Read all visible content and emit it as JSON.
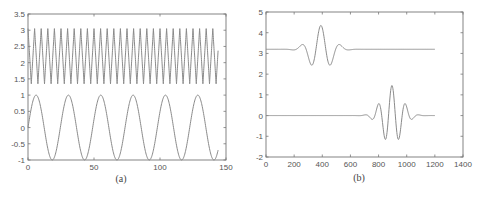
{
  "chart_data": [
    {
      "id": "a",
      "type": "line",
      "caption": "(a)",
      "title": "",
      "xlabel": "",
      "ylabel": "",
      "xlim": [
        0,
        150
      ],
      "ylim": [
        -1,
        3.5
      ],
      "xticks": [
        0,
        50,
        100,
        150
      ],
      "xtick_labels": [
        "0",
        "50",
        "100",
        "150"
      ],
      "yticks": [
        -1,
        -0.5,
        0,
        0.5,
        1,
        1.5,
        2,
        2.5,
        3,
        3.5
      ],
      "ytick_labels": [
        "-1",
        "-0.5",
        "0",
        "0.5",
        "1",
        "1.5",
        "2",
        "2.5",
        "3",
        "3.5"
      ],
      "grid": false,
      "legend": null,
      "series": [
        {
          "name": "high-frequency triangle wave",
          "kind": "triangle",
          "x_range": [
            0,
            144
          ],
          "min": 1.35,
          "max": 3.05,
          "period": 5.0,
          "phase_start_value": 2.2,
          "end_value": 2.2
        },
        {
          "name": "low-frequency sine wave",
          "kind": "sine",
          "x_range": [
            0,
            144
          ],
          "amplitude": 1.0,
          "offset": 0.0,
          "period": 24.5,
          "start_value": 0.0,
          "peaks_x": [
            6,
            30.5,
            55,
            79.5,
            104,
            128.5
          ],
          "troughs_x": [
            18.4,
            42.9,
            67.4,
            91.9,
            116.4,
            140.9
          ]
        }
      ]
    },
    {
      "id": "b",
      "type": "line",
      "caption": "(b)",
      "title": "",
      "xlabel": "",
      "ylabel": "",
      "xlim": [
        0,
        1400
      ],
      "ylim": [
        -2,
        5
      ],
      "xticks": [
        0,
        200,
        400,
        600,
        800,
        1000,
        1200,
        1400
      ],
      "xtick_labels": [
        "0",
        "200",
        "400",
        "600",
        "800",
        "1000",
        "1200",
        "1400"
      ],
      "yticks": [
        -2,
        -1,
        0,
        1,
        2,
        3,
        4,
        5
      ],
      "ytick_labels": [
        "-2",
        "-1",
        "0",
        "1",
        "2",
        "3",
        "4",
        "5"
      ],
      "grid": false,
      "legend": null,
      "series": [
        {
          "name": "upper wavelet packet",
          "kind": "wavelet",
          "x_range": [
            0,
            1200
          ],
          "baseline": 3.2,
          "center": 390,
          "peak": 4.35,
          "troughs": [
            2.6,
            2.6
          ],
          "troughs_x": [
            325,
            460
          ],
          "side_bumps": 3.35,
          "side_bumps_x": [
            250,
            535
          ]
        },
        {
          "name": "lower wavelet packet",
          "kind": "wavelet",
          "x_range": [
            0,
            1200
          ],
          "baseline": 0.0,
          "center": 895,
          "peak": 1.45,
          "secondary_peaks": [
            0.6,
            0.6
          ],
          "secondary_peaks_x": [
            800,
            995
          ],
          "troughs": [
            -1.05,
            -1.05
          ],
          "troughs_x": [
            850,
            945
          ],
          "small_dips": [
            -0.1,
            -0.1
          ],
          "small_dips_x": [
            760,
            1040
          ]
        }
      ]
    }
  ],
  "figure": {
    "caption_a": "(a)",
    "caption_b": "(b)"
  }
}
